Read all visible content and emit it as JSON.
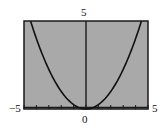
{
  "chart_data": {
    "type": "line",
    "title": "",
    "xlabel": "",
    "ylabel": "",
    "xlim": [
      -5,
      5
    ],
    "ylim": [
      0,
      5
    ],
    "grid": false,
    "legend": null,
    "function": "y = 0.25*x^2",
    "series": [
      {
        "name": "parabola",
        "x": [
          -4.47,
          -4,
          -3,
          -2,
          -1,
          0,
          1,
          2,
          3,
          4,
          4.47
        ],
        "values": [
          5,
          4,
          2.25,
          1,
          0.25,
          0,
          0.25,
          1,
          2.25,
          4,
          5
        ]
      }
    ],
    "x_ticks": [
      -5,
      -4,
      -3,
      -2,
      -1,
      0,
      1,
      2,
      3,
      4,
      5
    ],
    "labels": {
      "x_min": "−5",
      "x_max": "5",
      "y_max": "5",
      "origin": "0"
    }
  },
  "colors": {
    "plot_background": "#a9a9a9",
    "frame": "#1a1a1a",
    "curve": "#111111",
    "page_background": "#ffffff"
  }
}
